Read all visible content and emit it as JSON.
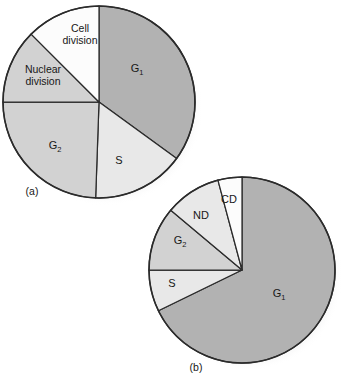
{
  "figure": {
    "background_color": "#ffffff",
    "outline_color": "#2b2b2b",
    "text_color": "#171717",
    "shadow_color": "#c9c9c9"
  },
  "palette": {
    "dark_gray": "#b2b2b2",
    "medium_gray": "#d2d2d2",
    "light_gray": "#e8e8e8",
    "white": "#fcfcfc"
  },
  "chart_data": [
    {
      "type": "pie",
      "id": "panel-a",
      "title": "(a)",
      "panel_label": "(a)",
      "center": {
        "x": 99,
        "y": 102
      },
      "radius": 96,
      "start_angle_deg": 0,
      "direction": "clockwise",
      "categories": [
        "G1",
        "S",
        "G2",
        "Nuclear division",
        "Cell division"
      ],
      "values": [
        35.0,
        15.6,
        24.4,
        12.5,
        12.5
      ],
      "angles_deg": [
        126,
        56,
        88,
        45,
        45
      ],
      "colors": [
        "#b2b2b2",
        "#e8e8e8",
        "#d2d2d2",
        "#d2d2d2",
        "#fcfcfc"
      ],
      "slices": [
        {
          "label": "G",
          "sub": "1",
          "label_full": "G1",
          "start_deg": 0,
          "end_deg": 126,
          "value": 35.0,
          "color": "#b2b2b2",
          "label_x": 137,
          "label_y": 69,
          "lines": [
            "G"
          ]
        },
        {
          "label": "S",
          "sub": "",
          "label_full": "S",
          "start_deg": 126,
          "end_deg": 182,
          "value": 15.6,
          "color": "#e8e8e8",
          "label_x": 119,
          "label_y": 161,
          "lines": [
            "S"
          ]
        },
        {
          "label": "G",
          "sub": "2",
          "label_full": "G2",
          "start_deg": 182,
          "end_deg": 270,
          "value": 24.4,
          "color": "#d2d2d2",
          "label_x": 55,
          "label_y": 146,
          "lines": [
            "G"
          ]
        },
        {
          "label": "Nuclear division",
          "sub": "",
          "label_full": "Nuclear division",
          "start_deg": 270,
          "end_deg": 315,
          "value": 12.5,
          "color": "#d2d2d2",
          "label_x": 43,
          "label_y": 73,
          "lines": [
            "Nuclear",
            "division"
          ]
        },
        {
          "label": "Cell division",
          "sub": "",
          "label_full": "Cell division",
          "start_deg": 315,
          "end_deg": 360,
          "value": 12.5,
          "color": "#fcfcfc",
          "label_x": 80,
          "label_y": 32,
          "lines": [
            "Cell",
            "division"
          ]
        }
      ],
      "panel_label_x": 32,
      "panel_label_y": 192
    },
    {
      "type": "pie",
      "id": "panel-b",
      "title": "(b)",
      "panel_label": "(b)",
      "center": {
        "x": 242,
        "y": 270
      },
      "radius": 93,
      "start_angle_deg": 0,
      "direction": "clockwise",
      "categories": [
        "G1",
        "S",
        "G2",
        "ND",
        "CD"
      ],
      "values": [
        67.8,
        7.2,
        11.1,
        9.7,
        4.2
      ],
      "angles_deg": [
        244,
        26,
        40,
        35,
        15
      ],
      "colors": [
        "#b2b2b2",
        "#e8e8e8",
        "#d2d2d2",
        "#e8e8e8",
        "#fcfcfc"
      ],
      "slices": [
        {
          "label": "G",
          "sub": "1",
          "label_full": "G1",
          "start_deg": 0,
          "end_deg": 244,
          "value": 67.8,
          "color": "#b2b2b2",
          "label_x": 279,
          "label_y": 294,
          "lines": [
            "G"
          ]
        },
        {
          "label": "S",
          "sub": "",
          "label_full": "S",
          "start_deg": 244,
          "end_deg": 270,
          "value": 7.2,
          "color": "#e8e8e8",
          "label_x": 172,
          "label_y": 284,
          "lines": [
            "S"
          ]
        },
        {
          "label": "G",
          "sub": "2",
          "label_full": "G2",
          "start_deg": 270,
          "end_deg": 310,
          "value": 11.1,
          "color": "#d2d2d2",
          "label_x": 180,
          "label_y": 241,
          "lines": [
            "G"
          ]
        },
        {
          "label": "ND",
          "sub": "",
          "label_full": "ND",
          "start_deg": 310,
          "end_deg": 345,
          "value": 9.7,
          "color": "#e8e8e8",
          "label_x": 201,
          "label_y": 216,
          "lines": [
            "ND"
          ]
        },
        {
          "label": "CD",
          "sub": "",
          "label_full": "CD",
          "start_deg": 345,
          "end_deg": 360,
          "value": 4.2,
          "color": "#fcfcfc",
          "label_x": 229,
          "label_y": 200,
          "lines": [
            "CD"
          ]
        }
      ],
      "panel_label_x": 196,
      "panel_label_y": 368
    }
  ]
}
